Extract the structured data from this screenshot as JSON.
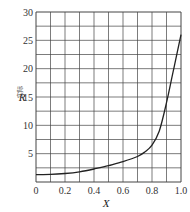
{
  "chart_data": {
    "type": "line",
    "title": "",
    "xlabel": "X",
    "ylabel": "R",
    "ylabel_subscript": "实际",
    "xlim": [
      0,
      1.0
    ],
    "ylim": [
      0,
      30
    ],
    "grid": true,
    "x_ticks": [
      "0",
      "0.2",
      "0.4",
      "0.6",
      "0.8",
      "1.0"
    ],
    "y_ticks": [
      "5",
      "10",
      "15",
      "20",
      "25",
      "30"
    ],
    "series": [
      {
        "name": "R",
        "x": [
          0.0,
          0.1,
          0.2,
          0.3,
          0.4,
          0.5,
          0.6,
          0.7,
          0.75,
          0.8,
          0.85,
          0.9,
          0.95,
          1.0
        ],
        "values": [
          1.3,
          1.35,
          1.5,
          1.8,
          2.3,
          2.9,
          3.6,
          4.5,
          5.3,
          6.5,
          9.0,
          14.0,
          20.0,
          26.0
        ]
      }
    ],
    "line_color": "#222222",
    "grid_color": "#444444"
  }
}
